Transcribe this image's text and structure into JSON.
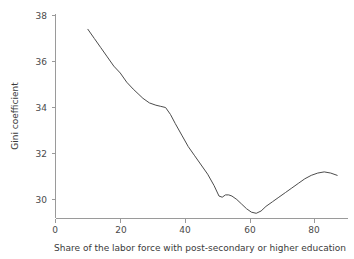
{
  "chart_data": {
    "type": "line",
    "title": "",
    "xlabel": "Share of the labor force with post-secondary or higher education",
    "ylabel": "Gini coefficient",
    "xlim": [
      0,
      90
    ],
    "ylim": [
      29.1,
      38.4
    ],
    "grid": false,
    "legend": null,
    "xticks": [
      0,
      20,
      40,
      60,
      80
    ],
    "xtick_labels": [
      "0",
      "20",
      "40",
      "60",
      "80"
    ],
    "yticks": [
      30,
      32,
      34,
      36,
      38
    ],
    "ytick_labels": [
      "30",
      "32",
      "34",
      "36",
      "38"
    ],
    "series": [
      {
        "name": "Gini coefficient",
        "color": "#4c4c4c",
        "x": [
          10.0,
          12.0,
          14.0,
          16.0,
          18.0,
          20.0,
          22.0,
          24.0,
          25.5,
          27.0,
          29.0,
          31.0,
          32.5,
          34.0,
          35.5,
          37.0,
          39.0,
          41.0,
          43.0,
          45.0,
          47.0,
          49.0,
          50.5,
          51.5,
          52.5,
          53.5,
          54.5,
          56.0,
          57.5,
          59.0,
          60.5,
          62.0,
          63.5,
          65.0,
          67.0,
          69.0,
          71.0,
          73.0,
          75.0,
          77.0,
          79.0,
          81.0,
          83.0,
          85.0,
          87.0
        ],
        "y": [
          37.4,
          37.0,
          36.6,
          36.2,
          35.8,
          35.5,
          35.1,
          34.8,
          34.6,
          34.4,
          34.2,
          34.1,
          34.05,
          34.0,
          33.7,
          33.3,
          32.8,
          32.3,
          31.9,
          31.5,
          31.1,
          30.6,
          30.15,
          30.1,
          30.2,
          30.2,
          30.15,
          30.0,
          29.8,
          29.6,
          29.45,
          29.4,
          29.5,
          29.7,
          29.9,
          30.1,
          30.3,
          30.5,
          30.7,
          30.9,
          31.05,
          31.15,
          31.2,
          31.15,
          31.05
        ]
      }
    ]
  }
}
